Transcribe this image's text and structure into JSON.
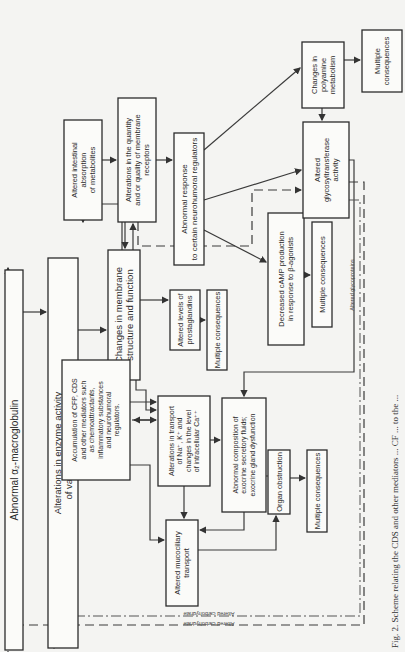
{
  "orientation": "rotated-90-ccw",
  "colors": {
    "ink": "#2b2b2b",
    "paper": "#f4f4f2",
    "box_fill": "#fbfbf9"
  },
  "boxes": [
    {
      "id": "alpha2",
      "name": "box-abnormal-alpha2-macroglobulin",
      "x": 5,
      "y": 270,
      "w": 18,
      "h": 380,
      "fs": 10,
      "lines": [
        "Abnormal α₂-macroglobulin"
      ]
    },
    {
      "id": "proteinases",
      "name": "box-proteinase-activity",
      "x": 48,
      "y": 258,
      "w": 30,
      "h": 390,
      "fs": 9.5,
      "lines": [
        "Alterations in enzyme activity",
        "of various proteinases"
      ]
    },
    {
      "id": "membrane",
      "name": "box-membrane-changes",
      "x": 108,
      "y": 250,
      "w": 32,
      "h": 130,
      "fs": 9.5,
      "lines": [
        "Changes in membrane",
        "structure and function"
      ]
    },
    {
      "id": "intestinal",
      "name": "box-intestinal-absorption",
      "x": 64,
      "y": 120,
      "w": 38,
      "h": 100,
      "fs": 7.5,
      "lines": [
        "Altered intestinal",
        "absorption",
        "of metabolites"
      ]
    },
    {
      "id": "receptors",
      "name": "box-membrane-receptors",
      "x": 118,
      "y": 98,
      "w": 38,
      "h": 124,
      "fs": 7.5,
      "lines": [
        "Alterations in the quantity",
        "and or quality of membrane",
        "receptors"
      ]
    },
    {
      "id": "neurohumoral",
      "name": "box-abnormal-neurohumoral-response",
      "x": 174,
      "y": 133,
      "w": 30,
      "h": 132,
      "fs": 8,
      "lines": [
        "Abnormal response",
        "to certain neurohumoral regulators"
      ]
    },
    {
      "id": "prostaglandins",
      "name": "box-prostaglandins",
      "x": 170,
      "y": 290,
      "w": 30,
      "h": 60,
      "fs": 7.5,
      "lines": [
        "Altered levels of",
        "prostaglandins"
      ]
    },
    {
      "id": "multi_prosta",
      "name": "box-multiple-consequences-prostaglandins",
      "x": 207,
      "y": 290,
      "w": 20,
      "h": 80,
      "fs": 7.5,
      "lines": [
        "Multiple consequences"
      ]
    },
    {
      "id": "accumulation",
      "name": "box-accumulation-mediators",
      "x": 62,
      "y": 360,
      "w": 68,
      "h": 120,
      "fs": 7,
      "lines": [
        "Accumulation of CFP, CDS",
        "and other mediators such",
        "as chemoattractants,",
        "inflammatory substances",
        "and neurohumoral",
        "regulators."
      ]
    },
    {
      "id": "transport",
      "name": "box-ion-transport",
      "x": 158,
      "y": 396,
      "w": 52,
      "h": 90,
      "fs": 7,
      "lines": [
        "Alterations in transport",
        "of Na⁺, K⁺ and",
        "changes in the level",
        "of intracellular Ca⁺⁺"
      ]
    },
    {
      "id": "exocrine",
      "name": "box-exocrine-composition",
      "x": 222,
      "y": 398,
      "w": 44,
      "h": 114,
      "fs": 7,
      "lines": [
        "Abnormal composition of",
        "exocrine secretory fluids;",
        "exocrine gland dysfunction"
      ]
    },
    {
      "id": "mucociliary",
      "name": "box-mucociliary-transport",
      "x": 166,
      "y": 520,
      "w": 32,
      "h": 86,
      "fs": 7.5,
      "lines": [
        "Altered mucociliary",
        "transport"
      ]
    },
    {
      "id": "obstruction",
      "name": "box-organ-obstruction",
      "x": 268,
      "y": 450,
      "w": 22,
      "h": 64,
      "fs": 7.5,
      "lines": [
        "Organ obstruction"
      ]
    },
    {
      "id": "multi_obstr",
      "name": "box-multiple-consequences-obstruction",
      "x": 307,
      "y": 450,
      "w": 20,
      "h": 82,
      "fs": 7.5,
      "lines": [
        "Multiple consequences"
      ]
    },
    {
      "id": "camp",
      "name": "box-decreased-camp",
      "x": 268,
      "y": 213,
      "w": 36,
      "h": 132,
      "fs": 7.5,
      "lines": [
        "Decreased cAMP production",
        "in response to β-agonists"
      ]
    },
    {
      "id": "multi_camp",
      "name": "box-multiple-consequences-camp",
      "x": 312,
      "y": 222,
      "w": 20,
      "h": 105,
      "fs": 7.5,
      "lines": [
        "Multiple consequences"
      ]
    },
    {
      "id": "glyco",
      "name": "box-glycosyltransferase",
      "x": 303,
      "y": 122,
      "w": 46,
      "h": 96,
      "fs": 7.5,
      "lines": [
        "Altered",
        "glycosyltransferase",
        "activity"
      ]
    },
    {
      "id": "polyamine",
      "name": "box-polyamine-metabolism",
      "x": 302,
      "y": 42,
      "w": 42,
      "h": 66,
      "fs": 7.5,
      "lines": [
        "Changes in",
        "polyamine",
        "metabolism"
      ]
    },
    {
      "id": "multi_poly",
      "name": "box-multiple-consequences-polyamine",
      "x": 362,
      "y": 30,
      "w": 40,
      "h": 62,
      "fs": 7.5,
      "lines": [
        "Multiple",
        "consequences"
      ]
    }
  ],
  "line_labels": [
    {
      "name": "label-altered-glycoproteins",
      "text": "Altered glycoproteins",
      "x": 354,
      "y": 285,
      "fs": 5.5,
      "rot": -90
    },
    {
      "name": "label-altered-carbohydrate-inner",
      "text": "Altered carbohydrate",
      "x": 209,
      "y": 612,
      "fs": 5.5,
      "rot": 180
    },
    {
      "name": "label-altered-carbohydrate-outer",
      "text": "Altered carbohydrate",
      "x": 209,
      "y": 622,
      "fs": 5.5,
      "rot": 180
    }
  ],
  "caption": {
    "text": "Fig. 2. Scheme relating the CDS and other mediators and cell-surface CF events to their ...",
    "visible": "Fig. 2.  Scheme relating the CDS and other mediators ... CF ... to the ..."
  }
}
